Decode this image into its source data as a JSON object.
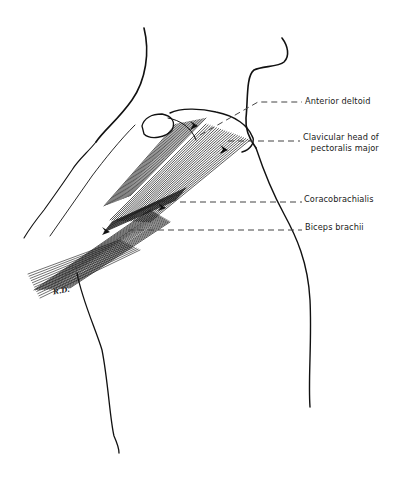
{
  "figure": {
    "labels": [
      {
        "id": "anterior-deltoid",
        "text": "Anterior deltoid"
      },
      {
        "id": "clavicular-head",
        "lines": [
          "Clavicular head of",
          "pectoralis major"
        ]
      },
      {
        "id": "coracobrachialis",
        "text": "Coracobrachialis"
      },
      {
        "id": "biceps-brachii",
        "text": "Biceps brachii"
      }
    ],
    "signature": "R.D."
  },
  "colors": {
    "ink": "#111111",
    "leader": "#444444",
    "background": "#ffffff"
  }
}
